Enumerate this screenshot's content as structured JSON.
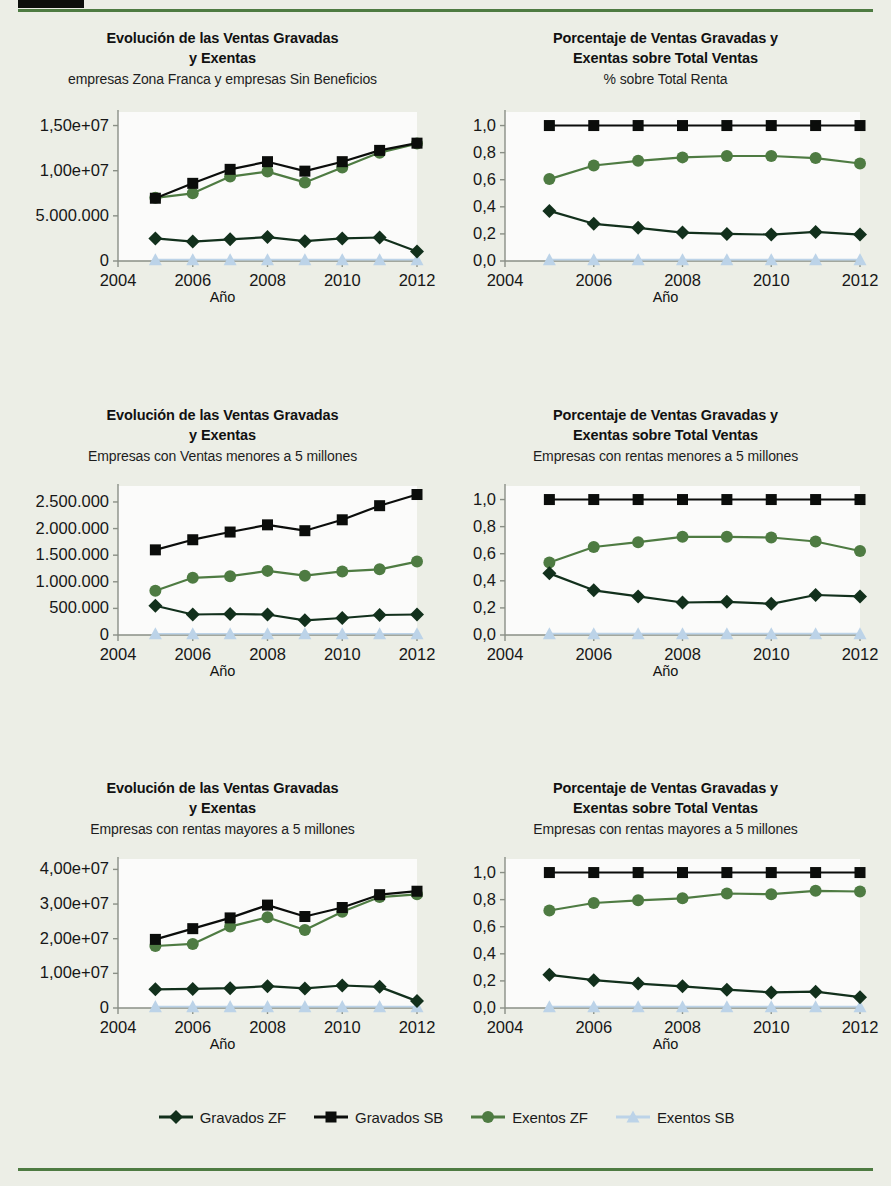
{
  "page": {
    "background_color": "#eceee6",
    "accent_rule_color": "#4e7b42",
    "header_block_color": "#0d0f0c"
  },
  "series_style": {
    "gravados_zf": {
      "label": "Gravados ZF",
      "color": "#12301c",
      "marker": "diamond"
    },
    "gravados_sb": {
      "label": "Gravados SB",
      "color": "#0b0d0b",
      "marker": "square"
    },
    "exentos_zf": {
      "label": "Exentos ZF",
      "color": "#4e7b42",
      "marker": "circle"
    },
    "exentos_sb": {
      "label": "Exentos SB",
      "color": "#bcd3e8",
      "marker": "triangle"
    }
  },
  "legend": {
    "items": [
      {
        "label": "Gravados ZF",
        "marker": "diamond",
        "color": "#12301c"
      },
      {
        "label": "Gravados SB",
        "marker": "square",
        "color": "#0b0d0b"
      },
      {
        "label": "Exentos ZF",
        "marker": "circle",
        "color": "#4e7b42"
      },
      {
        "label": "Exentos SB",
        "marker": "triangle",
        "color": "#bcd3e8"
      }
    ]
  },
  "chart_data": [
    {
      "id": "chart-1",
      "type": "line",
      "title": "Evolución de las Ventas Gravadas\ny Exentas",
      "title_line1": "Evolución de las Ventas Gravadas",
      "title_line2": "y Exentas",
      "subtitle": "empresas Zona Franca  y empresas Sin Beneficios",
      "xlabel": "Año",
      "ylabel": "",
      "x": [
        2005,
        2006,
        2007,
        2008,
        2009,
        2010,
        2011,
        2012
      ],
      "xlim": [
        2004,
        2012
      ],
      "xticks": [
        2004,
        2006,
        2008,
        2010,
        2012
      ],
      "xticklabels": [
        "2004",
        "2006",
        "2008",
        "2010",
        "2012"
      ],
      "ylim": [
        0,
        16500000
      ],
      "yticks": [
        0,
        5000000,
        10000000,
        15000000
      ],
      "yticklabels": [
        "0",
        "5.000.000",
        "1,00e+07",
        "1,50e+07"
      ],
      "grid": false,
      "series": [
        {
          "name": "Gravados ZF",
          "key": "gravados_zf",
          "values": [
            2500000,
            2150000,
            2400000,
            2650000,
            2200000,
            2500000,
            2600000,
            1050000
          ]
        },
        {
          "name": "Gravados SB",
          "key": "gravados_sb",
          "values": [
            6950000,
            8600000,
            10150000,
            11000000,
            9950000,
            11000000,
            12250000,
            13050000
          ]
        },
        {
          "name": "Exentos ZF",
          "key": "exentos_zf",
          "values": [
            7000000,
            7500000,
            9350000,
            9900000,
            8700000,
            10350000,
            12000000,
            13000000
          ]
        },
        {
          "name": "Exentos SB",
          "key": "exentos_sb",
          "values": [
            150000,
            150000,
            150000,
            150000,
            150000,
            150000,
            150000,
            150000
          ]
        }
      ]
    },
    {
      "id": "chart-2",
      "type": "line",
      "title_line1": "Porcentaje de Ventas Gravadas y",
      "title_line2": "Exentas sobre Total Ventas",
      "subtitle": "% sobre Total Renta",
      "xlabel": "Año",
      "ylabel": "",
      "x": [
        2005,
        2006,
        2007,
        2008,
        2009,
        2010,
        2011,
        2012
      ],
      "xlim": [
        2004,
        2012
      ],
      "xticks": [
        2004,
        2006,
        2008,
        2010,
        2012
      ],
      "xticklabels": [
        "2004",
        "2006",
        "2008",
        "2010",
        "2012"
      ],
      "ylim": [
        0.0,
        1.1
      ],
      "yticks": [
        0.0,
        0.2,
        0.4,
        0.6,
        0.8,
        1.0
      ],
      "yticklabels": [
        "0,0",
        "0,2",
        "0,4",
        "0,6",
        "0,8",
        "1,0"
      ],
      "grid": false,
      "series": [
        {
          "name": "Gravados ZF",
          "key": "gravados_zf",
          "values": [
            0.37,
            0.275,
            0.245,
            0.21,
            0.2,
            0.195,
            0.215,
            0.195
          ]
        },
        {
          "name": "Gravados SB",
          "key": "gravados_sb",
          "values": [
            1.0,
            1.0,
            1.0,
            1.0,
            1.0,
            1.0,
            1.0,
            1.0
          ]
        },
        {
          "name": "Exentos ZF",
          "key": "exentos_zf",
          "values": [
            0.605,
            0.705,
            0.74,
            0.765,
            0.775,
            0.775,
            0.76,
            0.72
          ]
        },
        {
          "name": "Exentos SB",
          "key": "exentos_sb",
          "values": [
            0.01,
            0.01,
            0.01,
            0.01,
            0.01,
            0.01,
            0.01,
            0.01
          ]
        }
      ]
    },
    {
      "id": "chart-3",
      "type": "line",
      "title_line1": "Evolución de las Ventas Gravadas",
      "title_line2": "y Exentas",
      "subtitle": "Empresas con Ventas menores a 5 millones",
      "xlabel": "Año",
      "ylabel": "",
      "x": [
        2005,
        2006,
        2007,
        2008,
        2009,
        2010,
        2011,
        2012
      ],
      "xlim": [
        2004,
        2012
      ],
      "xticks": [
        2004,
        2006,
        2008,
        2010,
        2012
      ],
      "xticklabels": [
        "2004",
        "2006",
        "2008",
        "2010",
        "2012"
      ],
      "ylim": [
        0,
        2800000
      ],
      "yticks": [
        0,
        500000,
        1000000,
        1500000,
        2000000,
        2500000
      ],
      "yticklabels": [
        "0",
        "500.000",
        "1.000.000",
        "1.500.000",
        "2.000.000",
        "2.500.000"
      ],
      "grid": false,
      "series": [
        {
          "name": "Gravados ZF",
          "key": "gravados_zf",
          "values": [
            550000,
            385000,
            395000,
            385000,
            275000,
            320000,
            375000,
            385000
          ]
        },
        {
          "name": "Gravados SB",
          "key": "gravados_sb",
          "values": [
            1600000,
            1790000,
            1935000,
            2070000,
            1960000,
            2165000,
            2430000,
            2640000
          ]
        },
        {
          "name": "Exentos ZF",
          "key": "exentos_zf",
          "values": [
            830000,
            1075000,
            1105000,
            1205000,
            1115000,
            1195000,
            1235000,
            1380000
          ]
        },
        {
          "name": "Exentos SB",
          "key": "exentos_sb",
          "values": [
            25000,
            25000,
            25000,
            25000,
            25000,
            25000,
            25000,
            25000
          ]
        }
      ]
    },
    {
      "id": "chart-4",
      "type": "line",
      "title_line1": "Porcentaje de Ventas Gravadas y",
      "title_line2": "Exentas sobre Total Ventas",
      "subtitle": "Empresas con rentas menores a 5 millones",
      "xlabel": "Año",
      "ylabel": "",
      "x": [
        2005,
        2006,
        2007,
        2008,
        2009,
        2010,
        2011,
        2012
      ],
      "xlim": [
        2004,
        2012
      ],
      "xticks": [
        2004,
        2006,
        2008,
        2010,
        2012
      ],
      "xticklabels": [
        "2004",
        "2006",
        "2008",
        "2010",
        "2012"
      ],
      "ylim": [
        0.0,
        1.1
      ],
      "yticks": [
        0.0,
        0.2,
        0.4,
        0.6,
        0.8,
        1.0
      ],
      "yticklabels": [
        "0,0",
        "0,2",
        "0,4",
        "0,6",
        "0,8",
        "1,0"
      ],
      "grid": false,
      "series": [
        {
          "name": "Gravados ZF",
          "key": "gravados_zf",
          "values": [
            0.455,
            0.33,
            0.285,
            0.24,
            0.245,
            0.23,
            0.295,
            0.285
          ]
        },
        {
          "name": "Gravados SB",
          "key": "gravados_sb",
          "values": [
            1.0,
            1.0,
            1.0,
            1.0,
            1.0,
            1.0,
            1.0,
            1.0
          ]
        },
        {
          "name": "Exentos ZF",
          "key": "exentos_zf",
          "values": [
            0.535,
            0.65,
            0.685,
            0.725,
            0.725,
            0.72,
            0.69,
            0.62
          ]
        },
        {
          "name": "Exentos SB",
          "key": "exentos_sb",
          "values": [
            0.01,
            0.01,
            0.01,
            0.01,
            0.01,
            0.01,
            0.01,
            0.01
          ]
        }
      ]
    },
    {
      "id": "chart-5",
      "type": "line",
      "title_line1": "Evolución de las Ventas Gravadas",
      "title_line2": "y Exentas",
      "subtitle": "Empresas con rentas mayores a 5 millones",
      "xlabel": "Año",
      "ylabel": "",
      "x": [
        2005,
        2006,
        2007,
        2008,
        2009,
        2010,
        2011,
        2012
      ],
      "xlim": [
        2004,
        2012
      ],
      "xticks": [
        2004,
        2006,
        2008,
        2010,
        2012
      ],
      "xticklabels": [
        "2004",
        "2006",
        "2008",
        "2010",
        "2012"
      ],
      "ylim": [
        0,
        43000000
      ],
      "yticks": [
        0,
        10000000,
        20000000,
        30000000,
        40000000
      ],
      "yticklabels": [
        "0",
        "1,00e+07",
        "2,00e+07",
        "3,00e+07",
        "4,00e+07"
      ],
      "grid": false,
      "series": [
        {
          "name": "Gravados ZF",
          "key": "gravados_zf",
          "values": [
            5400000,
            5500000,
            5700000,
            6300000,
            5650000,
            6500000,
            6100000,
            2000000
          ]
        },
        {
          "name": "Gravados SB",
          "key": "gravados_sb",
          "values": [
            19800000,
            22900000,
            26000000,
            29700000,
            26400000,
            29000000,
            32700000,
            33700000
          ]
        },
        {
          "name": "Exentos ZF",
          "key": "exentos_zf",
          "values": [
            17900000,
            18500000,
            23500000,
            26200000,
            22500000,
            27800000,
            32000000,
            32800000
          ]
        },
        {
          "name": "Exentos SB",
          "key": "exentos_sb",
          "values": [
            400000,
            400000,
            400000,
            400000,
            400000,
            400000,
            400000,
            400000
          ]
        }
      ]
    },
    {
      "id": "chart-6",
      "type": "line",
      "title_line1": "Porcentaje de Ventas Gravadas y",
      "title_line2": "Exentas sobre Total Ventas",
      "subtitle": "Empresas con rentas mayores a 5 millones",
      "xlabel": "Año",
      "ylabel": "",
      "x": [
        2005,
        2006,
        2007,
        2008,
        2009,
        2010,
        2011,
        2012
      ],
      "xlim": [
        2004,
        2012
      ],
      "xticks": [
        2004,
        2006,
        2008,
        2010,
        2012
      ],
      "xticklabels": [
        "2004",
        "2006",
        "2008",
        "2010",
        "2012"
      ],
      "ylim": [
        0.0,
        1.1
      ],
      "yticks": [
        0.0,
        0.2,
        0.4,
        0.6,
        0.8,
        1.0
      ],
      "yticklabels": [
        "0,0",
        "0,2",
        "0,4",
        "0,6",
        "0,8",
        "1,0"
      ],
      "grid": false,
      "series": [
        {
          "name": "Gravados ZF",
          "key": "gravados_zf",
          "values": [
            0.245,
            0.205,
            0.18,
            0.16,
            0.135,
            0.115,
            0.12,
            0.08
          ]
        },
        {
          "name": "Gravados SB",
          "key": "gravados_sb",
          "values": [
            1.0,
            1.0,
            1.0,
            1.0,
            1.0,
            1.0,
            1.0,
            1.0
          ]
        },
        {
          "name": "Exentos ZF",
          "key": "exentos_zf",
          "values": [
            0.72,
            0.775,
            0.795,
            0.81,
            0.845,
            0.84,
            0.865,
            0.86
          ]
        },
        {
          "name": "Exentos SB",
          "key": "exentos_sb",
          "values": [
            0.01,
            0.01,
            0.01,
            0.01,
            0.01,
            0.01,
            0.01,
            0.01
          ]
        }
      ]
    }
  ]
}
